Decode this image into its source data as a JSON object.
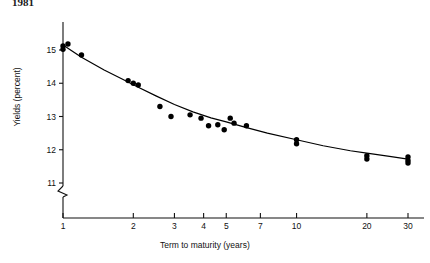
{
  "title": "1981",
  "axes": {
    "y": {
      "label": "Yields (percent)",
      "ticks": [
        11,
        12,
        13,
        14,
        15
      ],
      "tick_labels": [
        "11",
        "12",
        "13",
        "14",
        "15"
      ],
      "has_break": true
    },
    "x": {
      "label": "Term to maturity (years)",
      "ticks": [
        1,
        2,
        3,
        4,
        5,
        7,
        10,
        20,
        30
      ],
      "tick_labels": [
        "1",
        "2",
        "3",
        "4",
        "5",
        "7",
        "10",
        "20",
        "30"
      ],
      "scale": "log"
    }
  },
  "colors": {
    "marker": "#000000",
    "line": "#000000",
    "axis": "#111111",
    "background": "#ffffff"
  },
  "chart_data": {
    "type": "scatter",
    "title": "1981",
    "xlabel": "Term to maturity (years)",
    "ylabel": "Yields (percent)",
    "xscale": "log",
    "xlim": [
      0.85,
      33
    ],
    "ylim": [
      10.6,
      15.6
    ],
    "grid": false,
    "legend": "none",
    "points": [
      {
        "x": 1.0,
        "y": 15.12
      },
      {
        "x": 1.0,
        "y": 15.02
      },
      {
        "x": 1.05,
        "y": 15.18
      },
      {
        "x": 1.2,
        "y": 14.85
      },
      {
        "x": 1.9,
        "y": 14.08
      },
      {
        "x": 2.0,
        "y": 14.0
      },
      {
        "x": 2.1,
        "y": 13.95
      },
      {
        "x": 2.6,
        "y": 13.3
      },
      {
        "x": 2.9,
        "y": 13.0
      },
      {
        "x": 3.5,
        "y": 13.05
      },
      {
        "x": 3.9,
        "y": 12.95
      },
      {
        "x": 4.2,
        "y": 12.72
      },
      {
        "x": 4.6,
        "y": 12.75
      },
      {
        "x": 4.9,
        "y": 12.6
      },
      {
        "x": 5.2,
        "y": 12.95
      },
      {
        "x": 5.4,
        "y": 12.8
      },
      {
        "x": 6.1,
        "y": 12.72
      },
      {
        "x": 10.0,
        "y": 12.3
      },
      {
        "x": 10.0,
        "y": 12.18
      },
      {
        "x": 20.0,
        "y": 11.82
      },
      {
        "x": 20.0,
        "y": 11.72
      },
      {
        "x": 30.0,
        "y": 11.78
      },
      {
        "x": 30.0,
        "y": 11.68
      },
      {
        "x": 30.0,
        "y": 11.6
      }
    ],
    "fit_curve": {
      "description": "fitted decreasing yield curve",
      "x": [
        1.0,
        1.2,
        1.5,
        1.8,
        2.1,
        2.5,
        3.0,
        3.6,
        4.3,
        5.0,
        6.0,
        7.5,
        10.0,
        13.0,
        17.0,
        20.0,
        25.0,
        30.0
      ],
      "y": [
        15.15,
        14.78,
        14.4,
        14.12,
        13.88,
        13.62,
        13.36,
        13.14,
        12.96,
        12.84,
        12.68,
        12.5,
        12.3,
        12.12,
        11.97,
        11.9,
        11.8,
        11.72
      ]
    }
  }
}
